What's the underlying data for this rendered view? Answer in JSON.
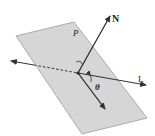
{
  "diagram": {
    "type": "geometry",
    "colors": {
      "plane_fill": "#d6d6d6",
      "plane_stroke": "#9a9a9a",
      "line": "#333333",
      "background": "#ffffff"
    },
    "labels": {
      "plane": "P",
      "normal": "N",
      "line": "L",
      "angle": "θ"
    }
  }
}
